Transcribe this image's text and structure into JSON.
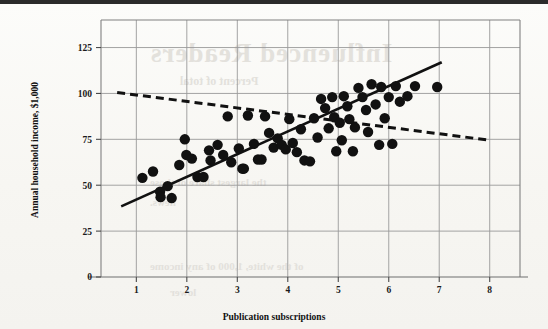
{
  "figure": {
    "background_color": "#fbfbf9",
    "ink_color": "#111111",
    "grid_color": "#9a9a9a",
    "frame_color": "#808080"
  },
  "ghost_text": {
    "title": "Influenced Readers",
    "subtitle": "Percent of total",
    "line1": "the largest share of those",
    "line2": "news.",
    "line3": "of the white, 1,000 of any income",
    "line4": "lower"
  },
  "chart_data": {
    "type": "scatter",
    "title": "",
    "xlabel": "Publication subscriptions",
    "ylabel": "Annual household income, $1,000",
    "xlim": [
      0.3,
      8.6
    ],
    "ylim": [
      0,
      140
    ],
    "xticks": [
      1,
      2,
      3,
      4,
      5,
      6,
      7,
      8
    ],
    "yticks": [
      0,
      25,
      50,
      75,
      100,
      125
    ],
    "xtick_labels": [
      "1",
      "2",
      "3",
      "4",
      "5",
      "6",
      "7",
      "8"
    ],
    "ytick_labels": [
      "0",
      "25",
      "50",
      "75",
      "100",
      "125"
    ],
    "grid": true,
    "grid_x": true,
    "grid_y": true,
    "legend": "none",
    "marker": "filled-circle",
    "marker_color": "#111111",
    "marker_size": 5.2,
    "points": [
      [
        1.12,
        54.0
      ],
      [
        1.33,
        57.5
      ],
      [
        1.47,
        46.5
      ],
      [
        1.48,
        43.5
      ],
      [
        1.62,
        49.5
      ],
      [
        1.7,
        43.0
      ],
      [
        1.85,
        61.0
      ],
      [
        1.96,
        75.0
      ],
      [
        1.99,
        66.5
      ],
      [
        2.1,
        64.5
      ],
      [
        2.21,
        54.5
      ],
      [
        2.33,
        54.5
      ],
      [
        2.44,
        69.0
      ],
      [
        2.47,
        63.5
      ],
      [
        2.61,
        72.0
      ],
      [
        2.72,
        66.5
      ],
      [
        2.81,
        87.5
      ],
      [
        2.88,
        62.5
      ],
      [
        3.03,
        70.0
      ],
      [
        3.1,
        59.0
      ],
      [
        3.13,
        59.0
      ],
      [
        3.21,
        88.0
      ],
      [
        3.33,
        72.5
      ],
      [
        3.41,
        64.0
      ],
      [
        3.48,
        64.0
      ],
      [
        3.55,
        87.5
      ],
      [
        3.63,
        78.5
      ],
      [
        3.72,
        70.5
      ],
      [
        3.8,
        75.5
      ],
      [
        3.88,
        72.0
      ],
      [
        3.96,
        69.5
      ],
      [
        4.03,
        86.0
      ],
      [
        4.1,
        73.0
      ],
      [
        4.18,
        68.0
      ],
      [
        4.26,
        80.5
      ],
      [
        4.33,
        63.5
      ],
      [
        4.44,
        63.0
      ],
      [
        4.52,
        86.5
      ],
      [
        4.59,
        76.0
      ],
      [
        4.66,
        97.0
      ],
      [
        4.74,
        92.0
      ],
      [
        4.81,
        81.0
      ],
      [
        4.88,
        98.0
      ],
      [
        4.92,
        87.0
      ],
      [
        4.96,
        68.5
      ],
      [
        5.03,
        84.0
      ],
      [
        5.07,
        74.5
      ],
      [
        5.11,
        98.5
      ],
      [
        5.18,
        93.0
      ],
      [
        5.22,
        86.0
      ],
      [
        5.29,
        68.5
      ],
      [
        5.33,
        81.5
      ],
      [
        5.4,
        103.0
      ],
      [
        5.48,
        98.0
      ],
      [
        5.55,
        91.0
      ],
      [
        5.59,
        79.0
      ],
      [
        5.66,
        105.0
      ],
      [
        5.74,
        94.0
      ],
      [
        5.81,
        72.0
      ],
      [
        5.85,
        103.5
      ],
      [
        5.92,
        86.5
      ],
      [
        6.0,
        98.0
      ],
      [
        6.07,
        72.5
      ],
      [
        6.14,
        104.0
      ],
      [
        6.22,
        95.5
      ],
      [
        6.37,
        98.5
      ],
      [
        6.52,
        104.0
      ],
      [
        6.96,
        103.5
      ]
    ],
    "trend_lines": [
      {
        "name": "solid-regression-line",
        "style": "solid",
        "color": "#111111",
        "width": 2.6,
        "x_start": 0.7,
        "y_start": 38.5,
        "x_end": 7.05,
        "y_end": 117.0
      },
      {
        "name": "dashed-regression-line",
        "style": "dashed",
        "color": "#111111",
        "width": 3.0,
        "dash_pattern": "8 5",
        "x_start": 0.62,
        "y_start": 100.5,
        "x_end": 8.0,
        "y_end": 74.5
      }
    ]
  }
}
